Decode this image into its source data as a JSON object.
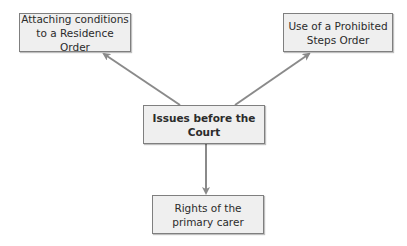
{
  "diagram": {
    "type": "hub-and-spoke",
    "colors": {
      "box_fill": "#efefef",
      "box_border": "#7f7f7f",
      "arrow": "#8a8a8a",
      "text": "#2b2b2b"
    },
    "center": {
      "label": "Issues before the Court"
    },
    "nodes": [
      {
        "id": "top-left",
        "line1": "Attaching conditions",
        "line2": "to a Residence Order"
      },
      {
        "id": "top-right",
        "line1": "Use of a Prohibited",
        "line2": "Steps Order"
      },
      {
        "id": "bottom",
        "line1": "Rights of the",
        "line2": "primary carer"
      }
    ],
    "edges": [
      {
        "from": "center",
        "to": "top-left"
      },
      {
        "from": "center",
        "to": "top-right"
      },
      {
        "from": "center",
        "to": "bottom"
      }
    ]
  }
}
